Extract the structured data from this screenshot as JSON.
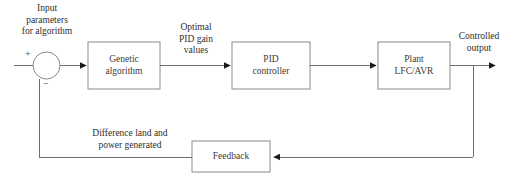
{
  "diagram": {
    "background_color": "#ffffff",
    "line_color": "#6e6e6e",
    "block_border_color": "#8a8a8a",
    "text_color": "#3a3a3a",
    "arrow_color": "#1a1a1a"
  },
  "blocks": [
    {
      "id": "genetic_algorithm",
      "line1": "Genetic",
      "line2": "algorithm"
    },
    {
      "id": "pid_controller",
      "line1": "PID",
      "line2": "controller"
    },
    {
      "id": "plant",
      "line1": "Plant",
      "line2": "LFC/AVR"
    },
    {
      "id": "feedback",
      "line1": "Feedback",
      "line2": ""
    }
  ],
  "summing_junction": {
    "plus_sign": "+",
    "minus_sign": "−"
  },
  "signal_labels": {
    "input": {
      "line1": "Input",
      "line2": "parameters",
      "line3": "for algorithm"
    },
    "optimal_gains": {
      "line1": "Optimal",
      "line2": "PID gain",
      "line3": "values"
    },
    "controlled_output": {
      "line1": "Controlled",
      "line2": "output"
    },
    "feedback_signal": {
      "line1": "Difference land and",
      "line2": "power generated"
    }
  }
}
